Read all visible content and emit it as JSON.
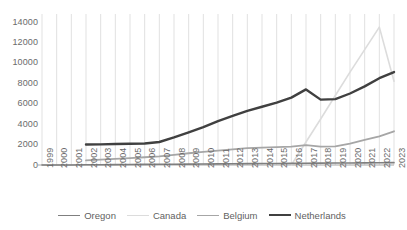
{
  "chart_data": {
    "type": "line",
    "title": "",
    "xlabel": "",
    "ylabel": "",
    "xlim": [
      1999,
      2023
    ],
    "ylim": [
      0,
      14000
    ],
    "ytick_step": 2000,
    "grid": "vertical-only",
    "legend_position": "bottom",
    "x": [
      1999,
      2000,
      2001,
      2002,
      2003,
      2004,
      2005,
      2006,
      2007,
      2008,
      2009,
      2010,
      2011,
      2012,
      2013,
      2014,
      2015,
      2016,
      2017,
      2018,
      2019,
      2020,
      2021,
      2022,
      2023
    ],
    "categories": [
      "1999",
      "2000",
      "2001",
      "2002",
      "2003",
      "2004",
      "2005",
      "2006",
      "2007",
      "2008",
      "2009",
      "2010",
      "2011",
      "2012",
      "2013",
      "2014",
      "2015",
      "2016",
      "2017",
      "2018",
      "2019",
      "2020",
      "2021",
      "2022",
      "2023"
    ],
    "ytick_labels": [
      "0",
      "2000",
      "4000",
      "6000",
      "8000",
      "10000",
      "12000",
      "14000"
    ],
    "ytick_values": [
      0,
      2000,
      4000,
      6000,
      8000,
      10000,
      12000,
      14000
    ],
    "series": [
      {
        "name": "Oregon",
        "color": "#7f7f7f",
        "width": 1.6,
        "values": [
          0,
          0,
          0,
          20,
          30,
          40,
          50,
          60,
          70,
          80,
          90,
          100,
          110,
          120,
          130,
          140,
          150,
          160,
          170,
          180,
          190,
          200,
          210,
          220,
          230
        ]
      },
      {
        "name": "Canada",
        "color": "#dcdcdc",
        "width": 1.6,
        "values": [
          null,
          null,
          null,
          null,
          null,
          null,
          null,
          null,
          null,
          null,
          null,
          null,
          null,
          null,
          null,
          null,
          null,
          0,
          2250,
          4500,
          6800,
          9100,
          11300,
          13500,
          8200
        ]
      },
      {
        "name": "Belgium",
        "color": "#a6a6a6",
        "width": 1.8,
        "values": [
          null,
          null,
          null,
          450,
          520,
          600,
          680,
          760,
          850,
          1000,
          1150,
          1280,
          1400,
          1520,
          1650,
          1700,
          1750,
          1800,
          1950,
          1800,
          1820,
          2100,
          2450,
          2800,
          3300
        ]
      },
      {
        "name": "Netherlands",
        "color": "#404040",
        "width": 2.4,
        "values": [
          null,
          null,
          null,
          2000,
          2020,
          2050,
          2080,
          2100,
          2250,
          2700,
          3200,
          3700,
          4300,
          4800,
          5300,
          5700,
          6100,
          6600,
          7400,
          6400,
          6450,
          7000,
          7700,
          8500,
          9100
        ]
      }
    ]
  },
  "legend": {
    "items": [
      {
        "label": "Oregon"
      },
      {
        "label": "Canada"
      },
      {
        "label": "Belgium"
      },
      {
        "label": "Netherlands"
      }
    ]
  },
  "axes": {
    "gridline_color": "#d9d9d9",
    "axis_color": "#a6a6a6",
    "tick_text_color": "#6b6b6b"
  }
}
